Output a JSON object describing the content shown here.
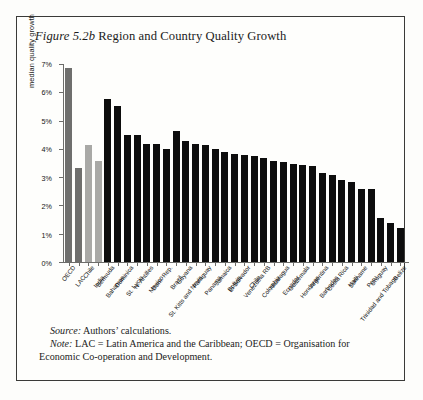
{
  "figure": {
    "label": "Figure 5.2b",
    "title": "Region and Country Quality Growth",
    "source_label": "Source:",
    "source_text": " Authors’ calculations.",
    "note_label": "Note:",
    "note_text": " LAC = Latin America and the Caribbean; OECD = Organisation for Economic Co-operation and Development."
  },
  "chart_data": {
    "type": "bar",
    "title": "Region and Country Quality Growth",
    "xlabel": "",
    "ylabel": "median quality growth",
    "ylim": [
      0,
      7
    ],
    "ytick_labels": [
      "0%",
      "1%",
      "2%",
      "3%",
      "4%",
      "5%",
      "6%",
      "7%"
    ],
    "ytick_values": [
      0,
      1,
      2,
      3,
      4,
      5,
      6,
      7
    ],
    "grid": false,
    "legend": "none",
    "units": "percent",
    "categories": [
      "OECD",
      "LAC",
      "Chile",
      "India",
      "Bermuda",
      "Bahamas",
      "Dominica",
      "St. Lucia",
      "N. Antilles",
      "Mexico",
      "Dom. Rep.",
      "Brazil",
      "Guyana",
      "St. Kitts and Nevis",
      "Paraguay",
      "Panama",
      "Jamaica",
      "Bolivia",
      "El Salvador",
      "Chile",
      "Venezuela RB",
      "Colombia",
      "Nicaragua",
      "Ecuador",
      "Guatemala",
      "Honduras",
      "Argentina",
      "Barbados",
      "Costa Rica",
      "Haiti",
      "Suriname",
      "Peru",
      "Uruguay",
      "Trinidad and Tobago",
      "Belize"
    ],
    "values": [
      6.9,
      3.35,
      4.15,
      3.6,
      5.8,
      5.55,
      4.5,
      4.5,
      4.2,
      4.2,
      4.0,
      4.65,
      4.3,
      4.2,
      4.15,
      4.0,
      3.9,
      3.85,
      3.8,
      3.75,
      3.7,
      3.6,
      3.55,
      3.5,
      3.45,
      3.4,
      3.15,
      3.1,
      2.9,
      2.85,
      2.6,
      2.6,
      1.55,
      1.4,
      1.2
    ],
    "bar_colors": [
      "#6f6f6d",
      "#6f6f6d",
      "#a9a9a6",
      "#a9a9a6",
      "#0d0d0d",
      "#0d0d0d",
      "#0d0d0d",
      "#0d0d0d",
      "#0d0d0d",
      "#0d0d0d",
      "#0d0d0d",
      "#0d0d0d",
      "#0d0d0d",
      "#0d0d0d",
      "#0d0d0d",
      "#0d0d0d",
      "#0d0d0d",
      "#0d0d0d",
      "#0d0d0d",
      "#0d0d0d",
      "#0d0d0d",
      "#0d0d0d",
      "#0d0d0d",
      "#0d0d0d",
      "#0d0d0d",
      "#0d0d0d",
      "#0d0d0d",
      "#0d0d0d",
      "#0d0d0d",
      "#0d0d0d",
      "#0d0d0d",
      "#0d0d0d",
      "#0d0d0d",
      "#0d0d0d",
      "#0d0d0d"
    ]
  }
}
